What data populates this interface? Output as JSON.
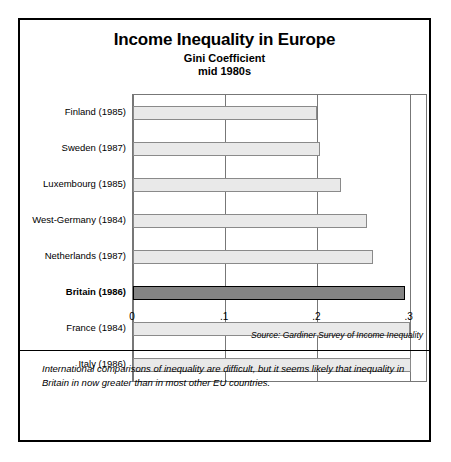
{
  "chart_data": {
    "type": "bar",
    "orientation": "horizontal",
    "title": "Income Inequality in Europe",
    "subtitle": "Gini Coefficient",
    "subtitle2": "mid 1980s",
    "xlabel": "",
    "ylabel": "",
    "xlim": [
      0,
      0.32
    ],
    "grid": true,
    "legend": false,
    "xticks": [
      "0",
      ".1",
      ".2",
      ".3"
    ],
    "xtick_values": [
      0,
      0.1,
      0.2,
      0.3
    ],
    "categories": [
      "Finland (1985)",
      "Sweden (1987)",
      "Luxembourg (1985)",
      "West-Germany (1984)",
      "Netherlands (1987)",
      "Britain (1986)",
      "France (1984)",
      "Italy (1986)"
    ],
    "values": [
      0.2,
      0.203,
      0.226,
      0.254,
      0.26,
      0.295,
      0.3,
      0.302
    ],
    "highlight_index": 5,
    "highlight_label": "Britain (1986)",
    "bar_fill": "#e9e9e9",
    "bar_border": "#8a8a8a",
    "highlight_fill": "#848484",
    "highlight_border": "#000000",
    "source": "Source: Gardiner Survey of Income Inequality",
    "annotation": "International comparisons of inequality are difficult, but it seems likely that inequality in Britain in now greater than in most other EU countries."
  }
}
